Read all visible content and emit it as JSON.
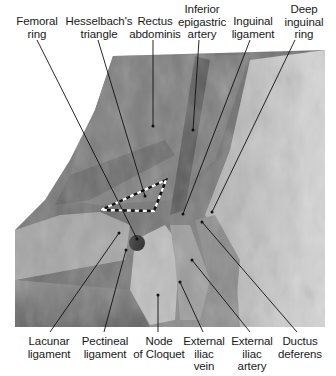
{
  "figure": {
    "type": "anatomical-photograph",
    "colors": {
      "background": "#ffffff",
      "label_text": "#1a1a1a",
      "leader_line": "#111111",
      "triangle_dash_dark": "#111111",
      "triangle_dash_light": "#ffffff"
    },
    "top_labels": [
      {
        "id": "femoral-ring",
        "text": "Femoral\nring"
      },
      {
        "id": "hesselbachs-triangle",
        "text": "Hesselbach's\ntriangle"
      },
      {
        "id": "rectus-abdominis",
        "text": "Rectus\nabdominis"
      },
      {
        "id": "inferior-epigastric-artery",
        "text": "Inferior\nepigastric\nartery"
      },
      {
        "id": "inguinal-ligament",
        "text": "Inguinal\nligament"
      },
      {
        "id": "deep-inguinal-ring",
        "text": "Deep\ninguinal\nring"
      }
    ],
    "bottom_labels": [
      {
        "id": "lacunar-ligament",
        "text": "Lacunar\nligament"
      },
      {
        "id": "pectineal-ligament",
        "text": "Pectineal\nligament"
      },
      {
        "id": "node-of-cloquet",
        "text": "Node\nof Cloquet"
      },
      {
        "id": "external-iliac-vein",
        "text": "External\niliac\nvein"
      },
      {
        "id": "external-iliac-artery",
        "text": "External\niliac\nartery"
      },
      {
        "id": "ductus-deferens",
        "text": "Ductus\ndeferens"
      }
    ]
  }
}
